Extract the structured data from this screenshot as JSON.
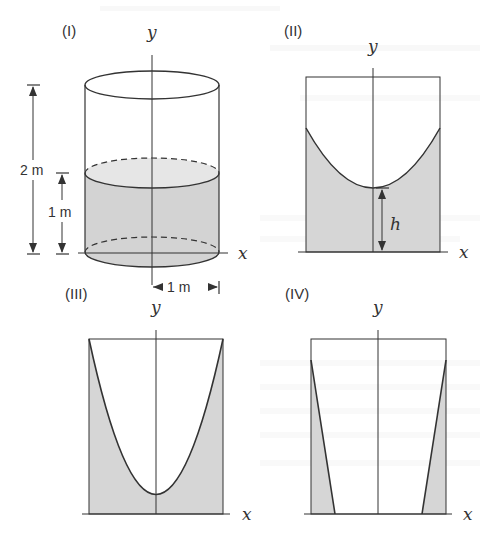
{
  "figure": {
    "colors": {
      "line": "#333333",
      "fill": "#d6d6d6",
      "fill_light": "#e4e4e4",
      "ghost_text": "#f0f0f0"
    },
    "panels": [
      {
        "id": "I",
        "label": "(I)",
        "y_axis_label": "y",
        "x_axis_label": "x",
        "shape": "cylinder",
        "dimensions": {
          "total_height_label": "2 m",
          "water_height_label": "1 m",
          "radius_label": "1 m"
        }
      },
      {
        "id": "II",
        "label": "(II)",
        "y_axis_label": "y",
        "x_axis_label": "x",
        "shape": "paraboloid water surface (rotating)",
        "annotation": "h"
      },
      {
        "id": "III",
        "label": "(III)",
        "y_axis_label": "y",
        "x_axis_label": "x",
        "shape": "deep paraboloid reaching rim"
      },
      {
        "id": "IV",
        "label": "(IV)",
        "y_axis_label": "y",
        "x_axis_label": "x",
        "shape": "thin wall water layers"
      }
    ]
  }
}
